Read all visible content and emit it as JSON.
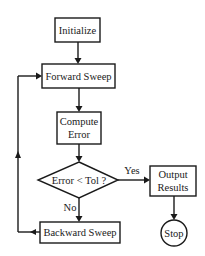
{
  "flowchart": {
    "nodes": {
      "initialize": {
        "label": "Initialize",
        "shape": "rectangle"
      },
      "forward_sweep": {
        "label": "Forward Sweep",
        "shape": "rectangle"
      },
      "compute_error": {
        "line1": "Compute",
        "line2": "Error",
        "shape": "rectangle"
      },
      "decision": {
        "label": "Error < Tol ?",
        "shape": "diamond"
      },
      "output_results": {
        "line1": "Output",
        "line2": "Results",
        "shape": "rectangle"
      },
      "stop": {
        "label": "Stop",
        "shape": "circle"
      },
      "backward_sweep": {
        "label": "Backward Sweep",
        "shape": "rectangle"
      }
    },
    "edges": {
      "yes_label": "Yes",
      "no_label": "No"
    },
    "colors": {
      "stroke": "#1a1a1a",
      "background": "#ffffff"
    }
  }
}
